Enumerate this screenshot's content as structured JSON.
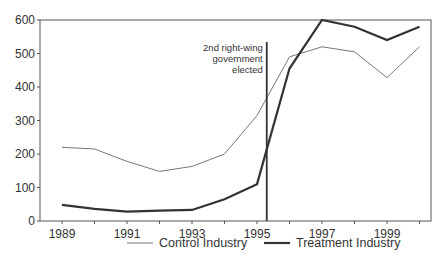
{
  "chart_data": {
    "type": "line",
    "title": "",
    "xlabel": "",
    "ylabel": "",
    "x": [
      1989,
      1990,
      1991,
      1992,
      1993,
      1994,
      1995,
      1996,
      1997,
      1998,
      1999,
      2000
    ],
    "series": [
      {
        "name": "Control Industry",
        "values": [
          220,
          215,
          178,
          148,
          163,
          200,
          315,
          490,
          520,
          505,
          428,
          520
        ],
        "color": "#777777",
        "line_width": 1
      },
      {
        "name": "Treatment Industry",
        "values": [
          48,
          36,
          28,
          31,
          33,
          65,
          110,
          455,
          600,
          580,
          540,
          580
        ],
        "color": "#333333",
        "line_width": 2.2
      }
    ],
    "xticks": [
      1989,
      1991,
      1993,
      1995,
      1997,
      1999
    ],
    "xtick_labels": [
      "1989",
      "1991",
      "1993",
      "1995",
      "1997",
      "1999"
    ],
    "yticks": [
      0,
      100,
      200,
      300,
      400,
      500,
      600
    ],
    "ytick_labels": [
      "0",
      "100",
      "200",
      "300",
      "400",
      "500",
      "600"
    ],
    "xlim": [
      1988.7,
      2000.7
    ],
    "ylim": [
      0,
      600
    ],
    "grid": false,
    "legend_position": "bottom",
    "annotations": [
      {
        "type": "vertical_line",
        "x": 1995.3,
        "text_lines": [
          "2nd right-wing",
          "government",
          "elected"
        ]
      }
    ]
  }
}
